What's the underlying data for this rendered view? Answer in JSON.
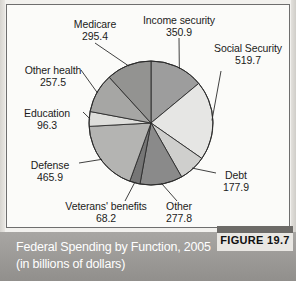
{
  "figure": {
    "tag_label": "FIGURE 19.7",
    "caption": "Federal Spending by Function, 2005 (in billions of dollars)"
  },
  "chart_data": {
    "type": "pie",
    "title": "Federal Spending by Function, 2005 (in billions of dollars)",
    "units": "billions of dollars",
    "year": "2005",
    "total": 2009.6,
    "legend_position": "none",
    "labels_position": "outside-with-leader-lines",
    "start_angle_deg": 0,
    "direction": "clockwise",
    "categories": [
      "Income security",
      "Social Security",
      "Debt",
      "Other",
      "Veterans' benefits",
      "Defense",
      "Education",
      "Other health",
      "Medicare"
    ],
    "values": [
      350.9,
      519.7,
      177.9,
      277.8,
      68.2,
      465.9,
      96.3,
      257.5,
      295.4
    ],
    "slices": [
      {
        "name": "Income security",
        "label": "Income security",
        "value": "350.9",
        "value_num": 350.9,
        "color": "#9d9d9d"
      },
      {
        "name": "Social Security",
        "label": "Social Security",
        "value": "519.7",
        "value_num": 519.7,
        "color": "#e6e6e4"
      },
      {
        "name": "Debt",
        "label": "Debt",
        "value": "177.9",
        "value_num": 177.9,
        "color": "#cfcfcd"
      },
      {
        "name": "Other",
        "label": "Other",
        "value": "277.8",
        "value_num": 277.8,
        "color": "#8a8a8a"
      },
      {
        "name": "Veterans' benefits",
        "label": "Veterans' benefits",
        "value": "68.2",
        "value_num": 68.2,
        "color": "#767676"
      },
      {
        "name": "Defense",
        "label": "Defense",
        "value": "465.9",
        "value_num": 465.9,
        "color": "#b4b4b2"
      },
      {
        "name": "Education",
        "label": "Education",
        "value": "96.3",
        "value_num": 96.3,
        "color": "#dededb"
      },
      {
        "name": "Other health",
        "label": "Other health",
        "value": "257.5",
        "value_num": 257.5,
        "color": "#a6a6a4"
      },
      {
        "name": "Medicare",
        "label": "Medicare",
        "value": "295.4",
        "value_num": 295.4,
        "color": "#939391"
      }
    ]
  }
}
